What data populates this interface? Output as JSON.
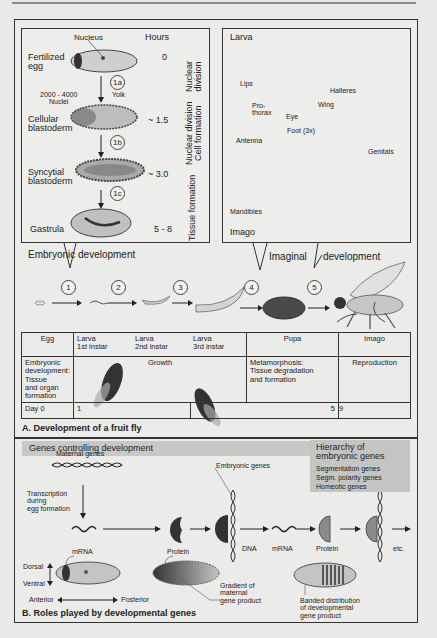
{
  "section_a": {
    "title": "A. Development of a fruit fly",
    "embryo_box": {
      "hours_header": "Hours",
      "nucleus_label": "Nucleus",
      "yolk_label": "Yolk",
      "nuclei_label": "2000 - 4000\nNuclei",
      "stages": [
        {
          "name": "Fertilized\negg",
          "hours": "0"
        },
        {
          "name": "Cellular\nblastoderm",
          "hours": "~ 1.5"
        },
        {
          "name": "Syncytial\nblastoderm",
          "hours": "~ 3.0"
        },
        {
          "name": "Gastrula",
          "hours": "5 - 8"
        }
      ],
      "steps": [
        "1a",
        "1b",
        "1c"
      ],
      "phases": [
        "Nuclear\ndivision",
        "Nuclear division\nCell formation",
        "Tissue formation"
      ],
      "caption": "Embryonic development"
    },
    "larva_box": {
      "larva_label": "Larva",
      "imago_label": "Imago",
      "parts": [
        "Lips",
        "Pro-\nthorax",
        "Eye",
        "Halteres",
        "Wing",
        "Foot (3x)",
        "Antenna",
        "Genitals",
        "Mandibles"
      ],
      "caption_left": "Imaginal",
      "caption_right": "development"
    },
    "sequence_numbers": [
      "1",
      "2",
      "3",
      "4",
      "5"
    ],
    "table": {
      "headers": [
        "Egg",
        "Larva\n1st instar",
        "Larva\n2nd instar",
        "Larva\n3rd instar",
        "Pupa",
        "Imago"
      ],
      "row2": {
        "egg": "Embryonic\ndevelopment:\nTissue\nand organ\nformation",
        "larva": "Growth",
        "pupa": "Metamorphosis:\nTissue degradation\nand formation",
        "imago": "Reproduction"
      },
      "days": {
        "label": "Day 0",
        "d1": "1",
        "d5": "5",
        "d9": "9"
      }
    }
  },
  "section_b": {
    "title": "B. Roles played by developmental genes",
    "genes_bar": "Genes controlling development",
    "hierarchy": {
      "title": "Hierarchy of\nembryonic genes",
      "items": [
        "Segmentation genes",
        "Segm. polarity genes",
        "Homeotic genes"
      ]
    },
    "maternal_genes": "Maternal genes",
    "transcription": "Transcription\nduring\negg formation",
    "embryonic_genes": "Embryonic genes",
    "flow_labels": [
      "mRNA",
      "Protein",
      "DNA",
      "mRNA",
      "Protein",
      "etc."
    ],
    "axes": {
      "dorsal": "Dorsal",
      "ventral": "Ventral",
      "anterior": "Anterior",
      "posterior": "Posterior"
    },
    "gradient_label": "Gradient of\nmaternal\ngene product",
    "banded_label": "Banded distribution\nof developmental\ngene product"
  },
  "colors": {
    "frame": "#333333",
    "background": "#ebebe9",
    "egg_fill": "#c9c9c7",
    "dark": "#2a2a2a",
    "gray_bar": "#c8c8c6"
  }
}
